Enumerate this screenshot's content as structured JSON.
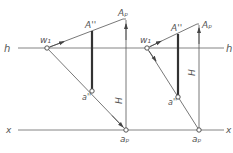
{
  "colors": {
    "line": "#555555",
    "thick": "#333333",
    "label": "#555555",
    "background": "#ffffff"
  },
  "axes": {
    "h": {
      "label": "h",
      "y": 48,
      "x1": 18,
      "x2": 225
    },
    "x": {
      "label": "x",
      "y": 130,
      "x1": 18,
      "x2": 225
    }
  },
  "labels": {
    "h_left": "h",
    "h_right": "h",
    "x_left": "x",
    "x_right": "x",
    "left": {
      "w1": "w₁",
      "A_dd": "A''",
      "A_p": "Aₚ",
      "a_dd": "a''",
      "a_p": "aₚ",
      "H": "H"
    },
    "right": {
      "w1": "w₁",
      "A_dd": "A''",
      "A_p": "Aₚ",
      "a_dd": "a''",
      "a_p": "aₚ",
      "H": "H"
    }
  },
  "figures": {
    "left": {
      "w1": [
        47,
        48
      ],
      "A_p": [
        123,
        19
      ],
      "A_dd_x": 92,
      "a_dd": [
        92,
        92
      ],
      "a_p": [
        126,
        130
      ]
    },
    "right": {
      "w1": [
        147,
        48
      ],
      "A_p": [
        199,
        24
      ],
      "A_dd_x": 178,
      "a_dd": [
        178,
        97
      ],
      "a_p": [
        199,
        130
      ]
    }
  }
}
